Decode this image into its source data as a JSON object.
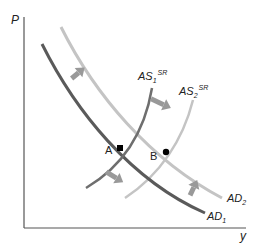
{
  "diagram": {
    "title": "",
    "axes": {
      "y_label": "P",
      "x_label": "y"
    },
    "curves": [
      {
        "id": "AD1",
        "label_main": "AD",
        "label_sub": "1",
        "label_sup": "",
        "color": "#5a5a5a"
      },
      {
        "id": "AD2",
        "label_main": "AD",
        "label_sub": "2",
        "label_sup": "",
        "color": "#c4c4c4"
      },
      {
        "id": "AS1",
        "label_main": "AS",
        "label_sub": "1",
        "label_sup": "SR",
        "color": "#6e6e6e"
      },
      {
        "id": "AS2",
        "label_main": "AS",
        "label_sub": "2",
        "label_sup": "SR",
        "color": "#c4c4c4"
      }
    ],
    "points": [
      {
        "id": "A",
        "label": "A"
      },
      {
        "id": "B",
        "label": "B"
      }
    ],
    "arrows": [
      {
        "id": "ad-shift-upper",
        "meaning": "AD shifts right (AD1 to AD2)"
      },
      {
        "id": "as-shift-upper",
        "meaning": "AS shifts right (AS1 to AS2)"
      },
      {
        "id": "as-shift-lower",
        "meaning": "AS shifts right (AS1 to AS2)"
      },
      {
        "id": "ad-shift-lower",
        "meaning": "AD shifts right (AD1 to AD2)"
      }
    ],
    "arrow_color": "#999999"
  }
}
